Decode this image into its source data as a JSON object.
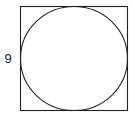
{
  "figure": {
    "background_color": "#ffffff",
    "stroke_color": "#222222",
    "label_color": "#1a1a1a",
    "square": {
      "name": "outer-square",
      "x": 20.5,
      "y": 6.5,
      "width": 107,
      "height": 104,
      "side_length_label": "9"
    },
    "circle": {
      "name": "inscribed-circle",
      "cx": 74,
      "cy": 58.5,
      "rx": 53.5,
      "ry": 52
    },
    "labels": [
      {
        "name": "square-side-label",
        "text": "9",
        "x": 8,
        "y": 60,
        "anchor": "left-side"
      }
    ]
  },
  "chart_data": {
    "type": "diagram",
    "annotations": [
      "9"
    ],
    "shapes": [
      {
        "shape": "square",
        "side": 9,
        "units": "unlabeled"
      },
      {
        "shape": "circle",
        "inscribed_in": "square",
        "diameter": 9
      }
    ]
  }
}
